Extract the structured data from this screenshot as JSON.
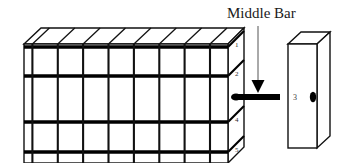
{
  "figure": {
    "background_color": "#ffffff",
    "stroke_color": "#111111",
    "heavy_stroke_color": "#000000"
  },
  "callout": {
    "title": "Middle Bar",
    "leader_line_color": "#555555",
    "arrow_color": "#000000"
  },
  "rack": {
    "columns": 8,
    "rows": 3,
    "level_labels": [
      {
        "text": "1"
      },
      {
        "text": "2"
      },
      {
        "text": "4"
      },
      {
        "text": "5"
      }
    ]
  },
  "middle_bar": {
    "level_number": "3",
    "bar_color": "#000000"
  },
  "side_box": {
    "label": "3",
    "marker": "oval-slot-icon",
    "marker_color": "#000000"
  }
}
